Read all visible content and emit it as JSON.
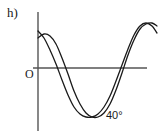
{
  "figure": {
    "part_label": "h)",
    "origin_label": "O",
    "angle_label": "40°",
    "background_color": "#ffffff",
    "axis_color": "#555555",
    "curve_color": "#1a1a1a"
  },
  "chart_data": {
    "type": "line",
    "title": "h)",
    "xlabel": "",
    "ylabel": "",
    "grid": false,
    "legend": false,
    "axes": {
      "x_axis_y_pixel": 68,
      "y_axis_x_pixel": 38,
      "x_axis_from_px": 33,
      "x_axis_to_px": 147,
      "y_axis_from_px": 12,
      "y_axis_to_px": 131
    },
    "annotations": [
      {
        "text": "O",
        "x_px": 27,
        "y_px": 74,
        "meaning": "origin"
      },
      {
        "text": "40°",
        "x_px": 107,
        "y_px": 118,
        "meaning": "angle-marker-near-trough"
      },
      {
        "text": "h)",
        "x_px": 8,
        "y_px": 16,
        "meaning": "sub-question-label"
      }
    ],
    "series": [
      {
        "name": "curve-1",
        "description": "cosine-like curve starting above axis near y-axis, falling to trough, rising to peak at right",
        "points_px": [
          [
            38,
            38
          ],
          [
            44,
            34
          ],
          [
            50,
            36
          ],
          [
            56,
            44
          ],
          [
            62,
            58
          ],
          [
            68,
            74
          ],
          [
            74,
            91
          ],
          [
            80,
            104
          ],
          [
            86,
            113
          ],
          [
            92,
            117
          ],
          [
            98,
            117
          ],
          [
            104,
            113
          ],
          [
            110,
            104
          ],
          [
            116,
            90
          ],
          [
            122,
            73
          ],
          [
            128,
            55
          ],
          [
            134,
            40
          ],
          [
            140,
            29
          ],
          [
            146,
            24
          ],
          [
            152,
            23
          ],
          [
            157,
            26
          ]
        ]
      },
      {
        "name": "curve-2",
        "description": "phase-shifted cosine-like curve, lower start, trough shifted right, peak earlier at right",
        "points_px": [
          [
            38,
            31
          ],
          [
            44,
            38
          ],
          [
            50,
            50
          ],
          [
            56,
            64
          ],
          [
            62,
            80
          ],
          [
            68,
            95
          ],
          [
            74,
            107
          ],
          [
            80,
            114
          ],
          [
            86,
            117
          ],
          [
            92,
            117
          ],
          [
            98,
            114
          ],
          [
            104,
            107
          ],
          [
            110,
            96
          ],
          [
            116,
            81
          ],
          [
            122,
            65
          ],
          [
            128,
            49
          ],
          [
            134,
            35
          ],
          [
            140,
            26
          ],
          [
            146,
            23
          ],
          [
            152,
            26
          ],
          [
            157,
            33
          ]
        ]
      }
    ]
  }
}
